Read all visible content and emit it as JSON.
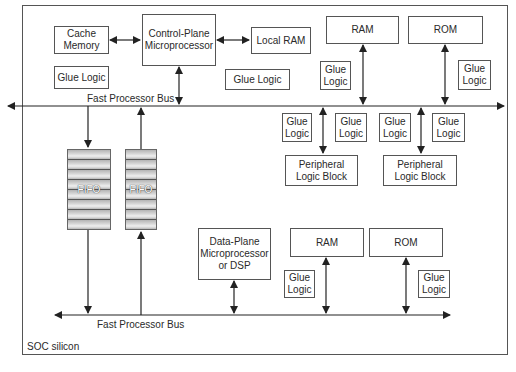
{
  "diagram": {
    "container_label": "SOC silicon",
    "buses": {
      "top": "Fast Processor Bus",
      "bottom": "Fast Processor Bus"
    },
    "blocks": {
      "cache_memory": "Cache\nMemory",
      "control_plane": "Control-Plane\nMicroprocessor",
      "local_ram": "Local RAM",
      "glue_left": "Glue Logic",
      "glue_mid": "Glue Logic",
      "ram_top": "RAM",
      "rom_top": "ROM",
      "glue_ram_top": "Glue\nLogic",
      "glue_rom_top": "Glue\nLogic",
      "glue_p1_left": "Glue\nLogic",
      "glue_p1_right": "Glue\nLogic",
      "glue_p2_left": "Glue\nLogic",
      "glue_p2_right": "Glue\nLogic",
      "peripheral_1": "Peripheral\nLogic Block",
      "peripheral_2": "Peripheral\nLogic Block",
      "fifo_1": "FIFO",
      "fifo_2": "FIFO",
      "data_plane": "Data-Plane\nMicroprocessor\nor DSP",
      "ram_bottom": "RAM",
      "rom_bottom": "ROM",
      "glue_ram_bottom": "Glue\nLogic",
      "glue_rom_bottom": "Glue\nLogic"
    },
    "connections": [
      {
        "from": "Cache Memory",
        "to": "Control-Plane Microprocessor",
        "type": "bidirectional"
      },
      {
        "from": "Control-Plane Microprocessor",
        "to": "Local RAM",
        "type": "bidirectional"
      },
      {
        "from": "Control-Plane Microprocessor",
        "to": "Fast Processor Bus (top)",
        "type": "bidirectional"
      },
      {
        "from": "RAM (top)",
        "to": "Fast Processor Bus (top)",
        "type": "bidirectional"
      },
      {
        "from": "ROM (top)",
        "to": "Fast Processor Bus (top)",
        "type": "bidirectional"
      },
      {
        "from": "Fast Processor Bus (top)",
        "to": "Peripheral Logic Block 1",
        "type": "bidirectional"
      },
      {
        "from": "Fast Processor Bus (top)",
        "to": "Peripheral Logic Block 2",
        "type": "bidirectional"
      },
      {
        "from": "Fast Processor Bus (top)",
        "to": "FIFO 1",
        "type": "directed"
      },
      {
        "from": "FIFO 1",
        "to": "Fast Processor Bus (bottom)",
        "type": "directed"
      },
      {
        "from": "Fast Processor Bus (bottom)",
        "to": "FIFO 2",
        "type": "directed"
      },
      {
        "from": "FIFO 2",
        "to": "Fast Processor Bus (top)",
        "type": "directed"
      },
      {
        "from": "Data-Plane Microprocessor or DSP",
        "to": "Fast Processor Bus (bottom)",
        "type": "bidirectional"
      },
      {
        "from": "RAM (bottom)",
        "to": "Fast Processor Bus (bottom)",
        "type": "bidirectional"
      },
      {
        "from": "ROM (bottom)",
        "to": "Fast Processor Bus (bottom)",
        "type": "bidirectional"
      }
    ]
  }
}
